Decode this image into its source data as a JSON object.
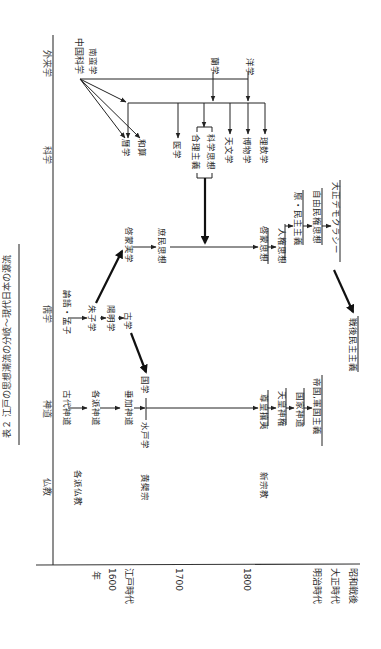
{
  "title": "表２ 江戸の思想潮流の分岐～現代日本の源流",
  "orientation": "rotated 90° clockwise (text reads top-to-bottom)",
  "row_headers": {
    "foreign": "外来学",
    "science": "科学",
    "confucian": "儒学",
    "shinto": "神道",
    "buddhism": "仏教"
  },
  "time_axis": {
    "unit": "年",
    "ticks": [
      "1600",
      "1700",
      "1800"
    ],
    "periods": [
      "江戸時代",
      "明治時代",
      "大正時代",
      "昭和戦後"
    ]
  },
  "nodes": {
    "chugoku_kagaku": "中国科学",
    "nanban_gaku": "南蛮学",
    "rangaku": "蘭学",
    "yogaku": "洋学",
    "rekigaku": "暦学",
    "wasan": "和算",
    "igaku": "医学",
    "gouri_shugi": "合理主義",
    "kagaku_shiso": "科学思想",
    "tenmongaku": "天文学",
    "hakubutsugaku": "博物学",
    "risugaku": "理数学",
    "keimo_jitsugaku": "啓蒙実学",
    "shomin_shiso": "庶民思想",
    "keimo_shiso": "啓蒙思想",
    "jinken_shiso": "人権思想",
    "gen_minshu_shugi": "原・民主主義",
    "jiyu_minken_shiso": "自由民権思想",
    "taisho_democracy": "大正デモクラシー",
    "rongo_moshi": "論語・孟子",
    "shushigaku": "朱子学",
    "yomeigaku": "陽明学",
    "kogaku": "古学",
    "sengo_minshu_shugi": "戦後民主主義",
    "kodai_shinto": "古代神道",
    "kakuha_shinto": "各派神道",
    "suika_shinto": "垂加神道",
    "kokugaku": "国学",
    "mitogaku": "水戸学",
    "sonno_joi": "尊皇攘夷",
    "tenno_shinken": "天皇神権",
    "kokka_shinto": "国家神道",
    "teikoku_gunkoku_shugi": "帝国,軍国主義",
    "kakuha_bukkyo": "各派仏教",
    "obakushu": "黄檗宗",
    "shin_shukyo": "新宗教"
  },
  "edges": [
    [
      "中国科学",
      "暦学"
    ],
    [
      "中国科学",
      "和算"
    ],
    [
      "中国科学",
      "科学分配線"
    ],
    [
      "蘭学",
      "科学分配線"
    ],
    [
      "洋学",
      "科学分配線"
    ],
    [
      "科学分配線",
      "暦学"
    ],
    [
      "科学分配線",
      "医学"
    ],
    [
      "科学分配線",
      "合理主義・科学思想"
    ],
    [
      "科学分配線",
      "天文学"
    ],
    [
      "科学分配線",
      "博物学"
    ],
    [
      "科学分配線",
      "理数学"
    ],
    [
      "合理主義・科学思想",
      "庶民思想ライン"
    ],
    [
      "朱子学",
      "啓蒙実学"
    ],
    [
      "啓蒙実学",
      "庶民思想"
    ],
    [
      "庶民思想",
      "啓蒙思想"
    ],
    [
      "啓蒙思想",
      "人権思想"
    ],
    [
      "人権思想",
      "原・民主主義"
    ],
    [
      "原・民主主義",
      "自由民権思想"
    ],
    [
      "自由民権思想",
      "大正デモクラシー"
    ],
    [
      "大正デモクラシー",
      "戦後民主主義"
    ],
    [
      "論語・孟子",
      "朱子学"
    ],
    [
      "朱子学",
      "陽明学"
    ],
    [
      "陽明学",
      "古学"
    ],
    [
      "古学",
      "国学"
    ],
    [
      "古代神道",
      "各派神道"
    ],
    [
      "各派神道",
      "垂加神道"
    ],
    [
      "垂加神道",
      "水戸学"
    ],
    [
      "水戸学",
      "尊皇攘夷"
    ],
    [
      "尊皇攘夷",
      "天皇神権"
    ],
    [
      "天皇神権",
      "国家神道"
    ],
    [
      "国家神道",
      "帝国,軍国主義"
    ]
  ]
}
